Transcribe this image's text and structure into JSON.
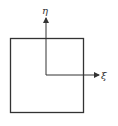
{
  "diagram": {
    "axes": {
      "vertical_label": "η",
      "horizontal_label": "ξ"
    },
    "colors": {
      "stroke": "#333333",
      "background": "#ffffff"
    }
  }
}
